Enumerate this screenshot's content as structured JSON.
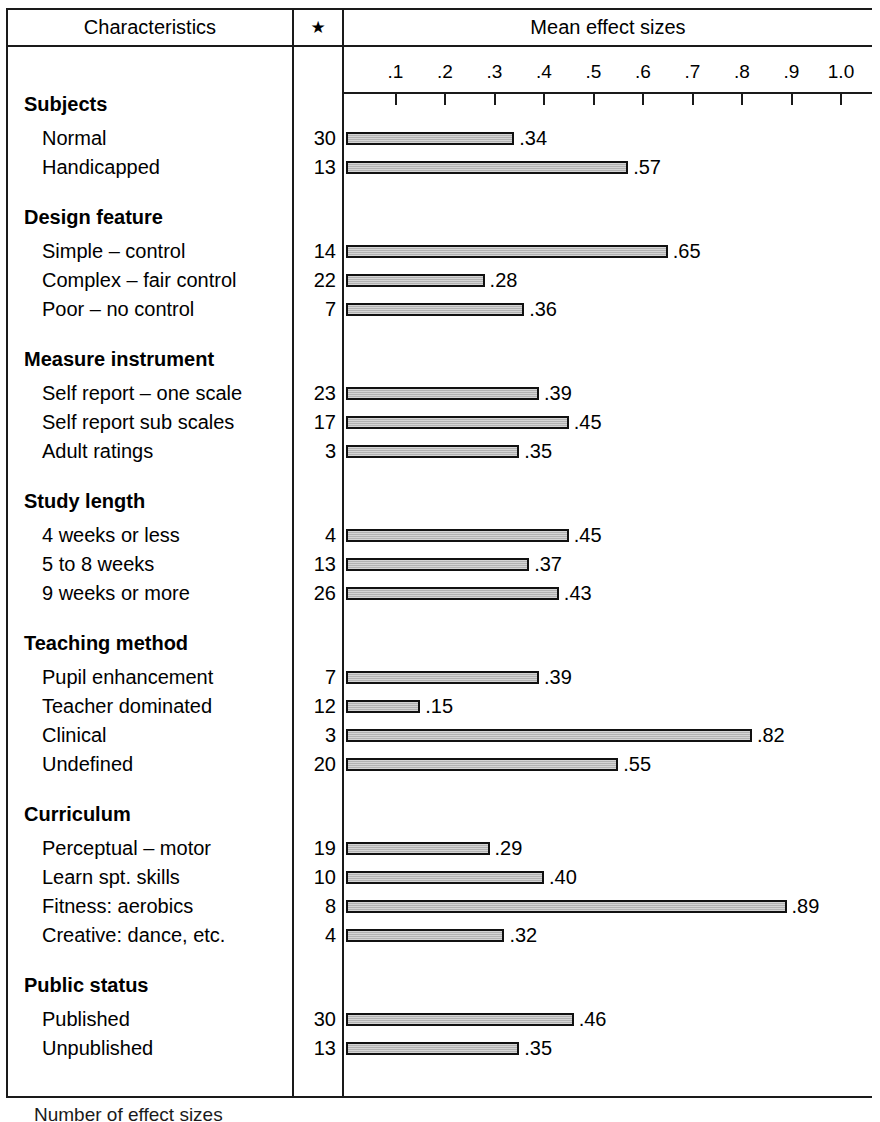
{
  "header": {
    "col_characteristics": "Characteristics",
    "col_star": "★",
    "col_mean": "Mean effect sizes"
  },
  "footnote": "Number of effect sizes",
  "colors": {
    "rule": "#1a1a1a",
    "bar_fill": "#b2b2b2",
    "bar_border": "#111111",
    "text": "#000000"
  },
  "chart_data": {
    "type": "bar",
    "title": "Mean effect sizes",
    "xlabel": "",
    "ylabel": "Characteristics",
    "xlim": [
      0,
      1.05
    ],
    "grid": false,
    "orientation": "horizontal",
    "axis_ticks": [
      ".1",
      ".2",
      ".3",
      ".4",
      ".5",
      ".6",
      ".7",
      ".8",
      ".9",
      "1.0"
    ],
    "axis_tick_values": [
      0.1,
      0.2,
      0.3,
      0.4,
      0.5,
      0.6,
      0.7,
      0.8,
      0.9,
      1.0
    ],
    "count_column_header": "★",
    "count_column_note": "Number of effect sizes",
    "groups": [
      {
        "name": "Subjects",
        "rows": [
          {
            "label": "Normal",
            "count": "30",
            "value": 0.34,
            "value_label": ".34"
          },
          {
            "label": "Handicapped",
            "count": "13",
            "value": 0.57,
            "value_label": ".57"
          }
        ]
      },
      {
        "name": "Design feature",
        "rows": [
          {
            "label": "Simple – control",
            "count": "14",
            "value": 0.65,
            "value_label": ".65"
          },
          {
            "label": "Complex – fair control",
            "count": "22",
            "value": 0.28,
            "value_label": ".28"
          },
          {
            "label": "Poor – no control",
            "count": "7",
            "value": 0.36,
            "value_label": ".36"
          }
        ]
      },
      {
        "name": "Measure instrument",
        "rows": [
          {
            "label": "Self report – one scale",
            "count": "23",
            "value": 0.39,
            "value_label": ".39"
          },
          {
            "label": "Self report sub scales",
            "count": "17",
            "value": 0.45,
            "value_label": ".45"
          },
          {
            "label": "Adult ratings",
            "count": "3",
            "value": 0.35,
            "value_label": ".35"
          }
        ]
      },
      {
        "name": "Study length",
        "rows": [
          {
            "label": "4 weeks or less",
            "count": "4",
            "value": 0.45,
            "value_label": ".45"
          },
          {
            "label": "5 to 8 weeks",
            "count": "13",
            "value": 0.37,
            "value_label": ".37"
          },
          {
            "label": "9 weeks or more",
            "count": "26",
            "value": 0.43,
            "value_label": ".43"
          }
        ]
      },
      {
        "name": "Teaching method",
        "rows": [
          {
            "label": "Pupil enhancement",
            "count": "7",
            "value": 0.39,
            "value_label": ".39"
          },
          {
            "label": "Teacher dominated",
            "count": "12",
            "value": 0.15,
            "value_label": ".15"
          },
          {
            "label": "Clinical",
            "count": "3",
            "value": 0.82,
            "value_label": ".82"
          },
          {
            "label": "Undefined",
            "count": "20",
            "value": 0.55,
            "value_label": ".55"
          }
        ]
      },
      {
        "name": "Curriculum",
        "rows": [
          {
            "label": "Perceptual – motor",
            "count": "19",
            "value": 0.29,
            "value_label": ".29"
          },
          {
            "label": "Learn spt. skills",
            "count": "10",
            "value": 0.4,
            "value_label": ".40"
          },
          {
            "label": "Fitness: aerobics",
            "count": "8",
            "value": 0.89,
            "value_label": ".89"
          },
          {
            "label": "Creative: dance, etc.",
            "count": "4",
            "value": 0.32,
            "value_label": ".32"
          }
        ]
      },
      {
        "name": "Public status",
        "rows": [
          {
            "label": "Published",
            "count": "30",
            "value": 0.46,
            "value_label": ".46"
          },
          {
            "label": "Unpublished",
            "count": "13",
            "value": 0.35,
            "value_label": ".35"
          }
        ]
      }
    ]
  }
}
